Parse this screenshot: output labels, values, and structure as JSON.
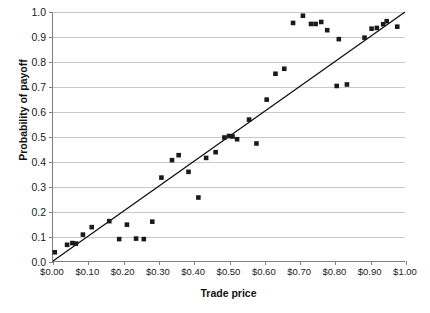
{
  "chart_data": {
    "type": "scatter",
    "title": "",
    "xlabel": "Trade price",
    "ylabel": "Probability of payoff",
    "xlim": [
      0.0,
      1.0
    ],
    "ylim": [
      0.0,
      1.0
    ],
    "grid": true,
    "legend": false,
    "x_tick_labels": [
      "$0.00",
      "$0.10",
      "$0.20",
      "$0.30",
      "$0.40",
      "$0.50",
      "$0.60",
      "$0.70",
      "$0.80",
      "$0.90",
      "$1.00"
    ],
    "x_tick_values": [
      0.0,
      0.1,
      0.2,
      0.3,
      0.4,
      0.5,
      0.6,
      0.7,
      0.8,
      0.9,
      1.0
    ],
    "y_tick_labels": [
      "0.0",
      "0.1",
      "0.2",
      "0.3",
      "0.4",
      "0.5",
      "0.6",
      "0.7",
      "0.8",
      "0.9",
      "1.0"
    ],
    "y_tick_values": [
      0.0,
      0.1,
      0.2,
      0.3,
      0.4,
      0.5,
      0.6,
      0.7,
      0.8,
      0.9,
      1.0
    ],
    "marker_color": "#1a1a1a",
    "marker_shape": "square",
    "line_color": "#111111",
    "grid_color": "#c8c8c8",
    "axis_color": "#808080",
    "series": [
      {
        "name": "Trades",
        "points": [
          [
            0.005,
            0.035
          ],
          [
            0.04,
            0.065
          ],
          [
            0.055,
            0.072
          ],
          [
            0.065,
            0.07
          ],
          [
            0.085,
            0.106
          ],
          [
            0.11,
            0.136
          ],
          [
            0.16,
            0.16
          ],
          [
            0.188,
            0.088
          ],
          [
            0.21,
            0.146
          ],
          [
            0.236,
            0.09
          ],
          [
            0.258,
            0.088
          ],
          [
            0.282,
            0.158
          ],
          [
            0.308,
            0.335
          ],
          [
            0.338,
            0.405
          ],
          [
            0.357,
            0.425
          ],
          [
            0.385,
            0.358
          ],
          [
            0.413,
            0.255
          ],
          [
            0.435,
            0.414
          ],
          [
            0.462,
            0.437
          ],
          [
            0.487,
            0.496
          ],
          [
            0.5,
            0.502
          ],
          [
            0.51,
            0.5
          ],
          [
            0.523,
            0.489
          ],
          [
            0.557,
            0.568
          ],
          [
            0.578,
            0.472
          ],
          [
            0.607,
            0.648
          ],
          [
            0.632,
            0.752
          ],
          [
            0.657,
            0.772
          ],
          [
            0.682,
            0.956
          ],
          [
            0.71,
            0.985
          ],
          [
            0.733,
            0.952
          ],
          [
            0.746,
            0.952
          ],
          [
            0.762,
            0.96
          ],
          [
            0.779,
            0.927
          ],
          [
            0.806,
            0.703
          ],
          [
            0.835,
            0.709
          ],
          [
            0.812,
            0.891
          ],
          [
            0.885,
            0.897
          ],
          [
            0.905,
            0.933
          ],
          [
            0.92,
            0.936
          ],
          [
            0.938,
            0.951
          ],
          [
            0.948,
            0.963
          ],
          [
            0.978,
            0.941
          ]
        ]
      }
    ],
    "fit_line": {
      "name": "45-degree reference line",
      "x0": 0.0,
      "y0": 0.0,
      "x1": 1.0,
      "y1": 1.0
    }
  }
}
